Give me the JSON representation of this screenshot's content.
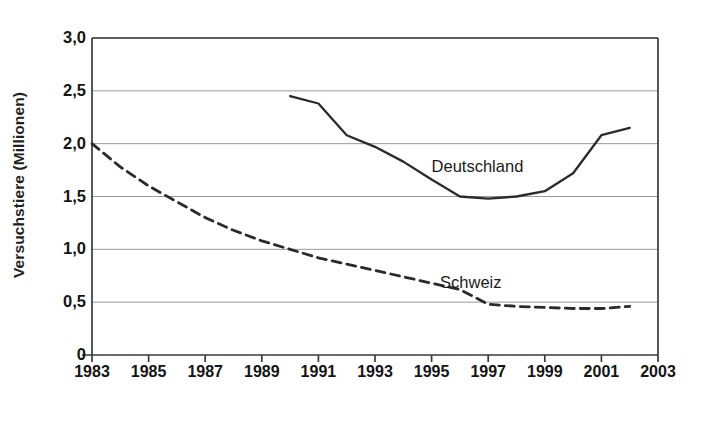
{
  "chart_data": {
    "type": "line",
    "title": "",
    "xlabel": "",
    "ylabel": "Versuchstiere (Millionen)",
    "xlim": [
      1983,
      2003
    ],
    "ylim": [
      0,
      3.0
    ],
    "xticks": [
      "1983",
      "1985",
      "1987",
      "1989",
      "1991",
      "1993",
      "1995",
      "1997",
      "1999",
      "2001",
      "2003"
    ],
    "xtick_values": [
      1983,
      1985,
      1987,
      1989,
      1991,
      1993,
      1995,
      1997,
      1999,
      2001,
      2003
    ],
    "yticks": [
      "0",
      "0,5",
      "1,0",
      "1,5",
      "2,0",
      "2,5",
      "3,0"
    ],
    "ytick_values": [
      0,
      0.5,
      1.0,
      1.5,
      2.0,
      2.5,
      3.0
    ],
    "grid": "horizontal",
    "legend_position": "inline-annotation",
    "series": [
      {
        "name": "Deutschland",
        "style": "solid",
        "color": "#2b2b2b",
        "label_x": 1995.0,
        "label_y": 1.78,
        "x": [
          1990,
          1991,
          1992,
          1993,
          1994,
          1995,
          1996,
          1997,
          1998,
          1999,
          2000,
          2001,
          2002
        ],
        "values": [
          2.45,
          2.38,
          2.08,
          1.97,
          1.83,
          1.66,
          1.5,
          1.48,
          1.5,
          1.55,
          1.72,
          2.08,
          2.15
        ]
      },
      {
        "name": "Schweiz",
        "style": "dashed",
        "color": "#2b2b2b",
        "label_x": 1995.3,
        "label_y": 0.68,
        "x": [
          1983,
          1984,
          1985,
          1986,
          1987,
          1988,
          1989,
          1990,
          1991,
          1992,
          1993,
          1994,
          1995,
          1996,
          1997,
          1998,
          1999,
          2000,
          2001,
          2002
        ],
        "values": [
          2.0,
          1.78,
          1.6,
          1.45,
          1.3,
          1.18,
          1.08,
          1.0,
          0.92,
          0.86,
          0.8,
          0.74,
          0.68,
          0.62,
          0.48,
          0.46,
          0.45,
          0.44,
          0.44,
          0.46
        ]
      }
    ]
  },
  "axis": {
    "y_title": "Versuchstiere (Millionen)"
  }
}
